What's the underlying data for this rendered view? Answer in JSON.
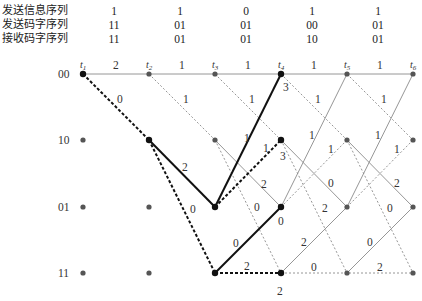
{
  "header_table": {
    "rows": [
      {
        "label": "发送信息序列",
        "values": [
          "1",
          "1",
          "0",
          "1",
          "1"
        ]
      },
      {
        "label": "发送码字序列",
        "values": [
          "11",
          "01",
          "01",
          "00",
          "01"
        ]
      },
      {
        "label": "接收码字序列",
        "values": [
          "11",
          "01",
          "01",
          "10",
          "01"
        ]
      }
    ],
    "column_x": [
      114,
      180,
      246,
      312,
      378
    ]
  },
  "trellis": {
    "states": [
      "00",
      "10",
      "01",
      "11"
    ],
    "times": [
      "t1",
      "t2",
      "t3",
      "t4",
      "t5",
      "t6"
    ],
    "time_subscripts": [
      "1",
      "2",
      "3",
      "4",
      "5",
      "6"
    ],
    "top_edge_labels": [
      "2",
      "1",
      "1",
      "1",
      "1"
    ],
    "path_metrics_shown": {
      "t4_00": "3",
      "t4_10": "3",
      "t4_01": "0",
      "t4_11": "2"
    },
    "edge_labels": {
      "t1_00_10": "0",
      "t2_00_10": "1",
      "t2_10_01": "2",
      "t2_10_11": "0",
      "t3_00_10": "1",
      "t3_01_00": "1",
      "t3_01_10": "1",
      "t3_10_01": "2",
      "t3_10_11": "0",
      "t3_11_01": "0",
      "t3_11_11": "2",
      "t4_00_10": "1",
      "t4_01_00": "1",
      "t4_01_10": "1",
      "t4_10_01": "0",
      "t4_10_11": "2",
      "t4_11_01": "2",
      "t4_11_11": "0",
      "t5_00_10": "1",
      "t5_01_00": "1",
      "t5_01_10": "1",
      "t5_10_01": "2",
      "t5_10_11": "0",
      "t5_11_01": "0",
      "t5_11_11": "2"
    },
    "colors": {
      "survivor": "#111111",
      "branch": "#888888",
      "node_active": "#111111",
      "node_inactive": "#555555"
    }
  }
}
